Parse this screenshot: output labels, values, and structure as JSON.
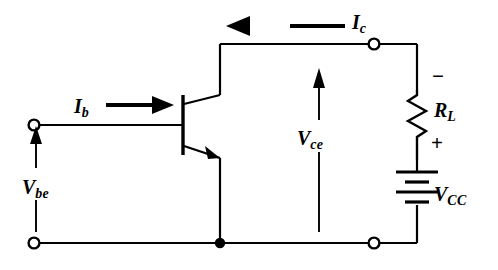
{
  "figure": {
    "name": "common-emitter-transistor-circuit",
    "background_color": "#ffffff",
    "line_color": "#000000",
    "width": 498,
    "height": 270
  },
  "labels": {
    "base_current": {
      "symbol": "I",
      "subscript": "b"
    },
    "collector_current": {
      "symbol": "I",
      "subscript": "c"
    },
    "base_emitter_voltage": {
      "symbol": "V",
      "subscript": "be"
    },
    "collector_emitter_voltage": {
      "symbol": "V",
      "subscript": "ce"
    },
    "load_resistor": {
      "symbol": "R",
      "subscript": "L"
    },
    "supply_voltage": {
      "symbol": "V",
      "subscript": "CC"
    }
  },
  "polarity": {
    "resistor_top": "−",
    "resistor_bottom": "+"
  },
  "components": {
    "transistor": {
      "type": "npn-bipolar-junction-transistor"
    },
    "resistor": {
      "type": "zigzag-resistor"
    },
    "battery": {
      "type": "battery-cell-stack"
    },
    "terminals": {
      "type": "open-circle-terminal",
      "count": 4
    },
    "junctions": {
      "type": "filled-junction-dot",
      "count": 1
    }
  }
}
